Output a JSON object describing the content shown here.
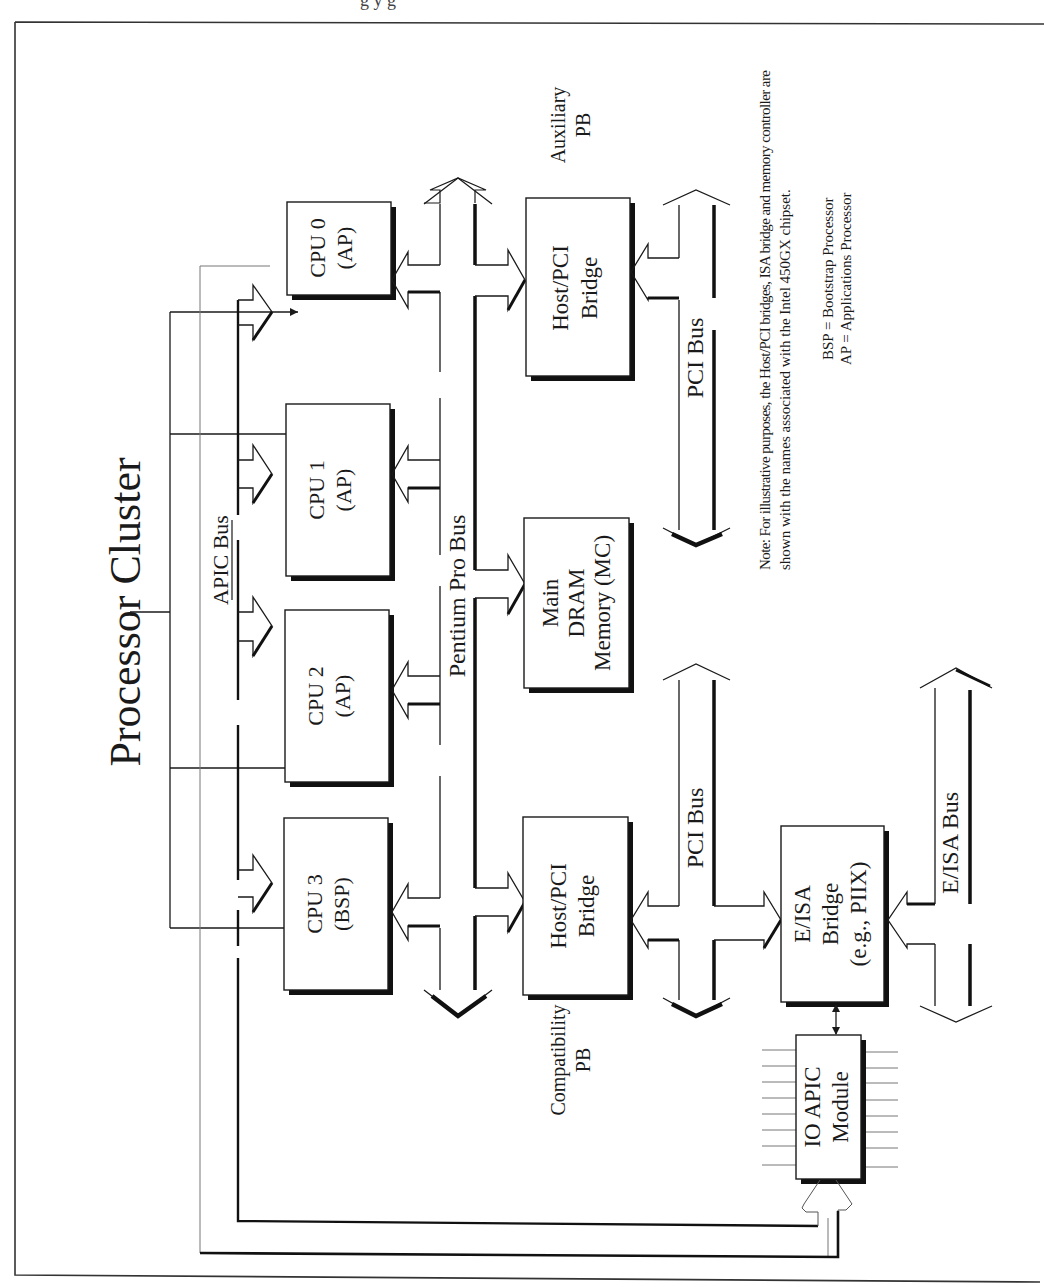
{
  "figure": {
    "caption_fragment": "g  y  g",
    "title": "Processor Cluster"
  },
  "buses": {
    "apic": "APIC Bus",
    "pentium_pro": "Pentium Pro Bus",
    "pci_upper": "PCI Bus",
    "pci_lower": "PCI Bus",
    "eisa": "E/ISA Bus"
  },
  "blocks": {
    "cpu0": {
      "line1": "CPU 0",
      "line2": "(AP)"
    },
    "cpu1": {
      "line1": "CPU 1",
      "line2": "(AP)"
    },
    "cpu2": {
      "line1": "CPU 2",
      "line2": "(AP)"
    },
    "cpu3": {
      "line1": "CPU 3",
      "line2": "(BSP)"
    },
    "host_pci_aux": {
      "line1": "Host/PCI",
      "line2": "Bridge"
    },
    "host_pci_compat": {
      "line1": "Host/PCI",
      "line2": "Bridge"
    },
    "memory": {
      "line1": "Main",
      "line2": "DRAM",
      "line3": "Memory (MC)"
    },
    "eisa_bridge": {
      "line1": "E/ISA",
      "line2": "Bridge",
      "line3": "(e.g., PIIX)"
    },
    "io_apic": {
      "line1": "IO APIC",
      "line2": "Module"
    }
  },
  "labels": {
    "auxiliary_pb": {
      "line1": "Auxiliary",
      "line2": "PB"
    },
    "compatibility_pb": {
      "line1": "Compatibility",
      "line2": "PB"
    }
  },
  "notes": {
    "note_line1": "Note: For illustrative purposes, the Host/PCI bridges, ISA bridge and memory controller are",
    "note_line2": "shown with the names associated with the Intel 450GX chipset.",
    "legend_bsp": "BSP = Bootstrap Processor",
    "legend_ap": "AP = Applications Processor"
  }
}
